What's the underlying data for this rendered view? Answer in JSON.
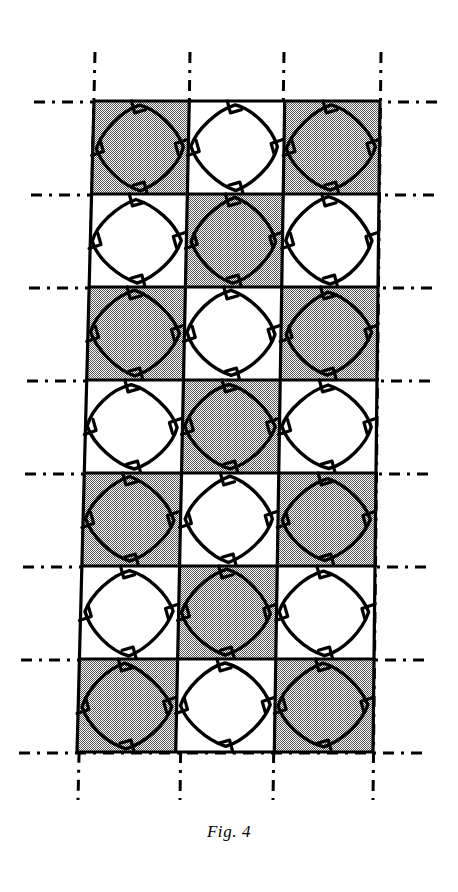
{
  "figure": {
    "caption": "Fig. 4",
    "title": "Fig. 4",
    "colors": {
      "ink": "#000000",
      "shaded_fill": "#b4b4b4",
      "unshaded_fill": "#ffffff",
      "background": "#ffffff"
    },
    "grid": {
      "columns": 3,
      "rows": 7,
      "column_labels": [
        "1",
        "2",
        "3"
      ],
      "row_labels": [
        "1",
        "2",
        "3",
        "4",
        "5",
        "6",
        "7"
      ],
      "cell_fill_pattern": "checkerboard",
      "cells": [
        [
          "shaded",
          "unshaded",
          "shaded"
        ],
        [
          "unshaded",
          "shaded",
          "unshaded"
        ],
        [
          "shaded",
          "unshaded",
          "shaded"
        ],
        [
          "unshaded",
          "shaded",
          "unshaded"
        ],
        [
          "shaded",
          "unshaded",
          "shaded"
        ],
        [
          "unshaded",
          "shaded",
          "unshaded"
        ],
        [
          "shaded",
          "unshaded",
          "shaded"
        ]
      ],
      "motif": "rounded-diamond-tile",
      "motif_count": 21,
      "shaded_count": 11,
      "unshaded_count": 10
    },
    "construction_lines": {
      "style": "dash-dot",
      "vertical_count": 4,
      "horizontal_count": 8,
      "extends_beyond_pattern": "true"
    }
  }
}
